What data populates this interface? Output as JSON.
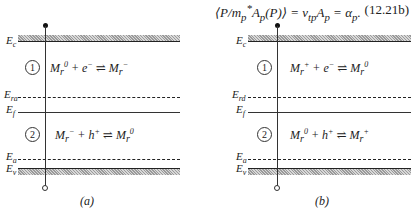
{
  "equation": {
    "text": "⟨P/m*ₚAₚ(P)⟩ = v_tpAₚ = αₚ.",
    "number": "(12.21b)"
  },
  "panels": [
    {
      "caption": "(a)",
      "levels": {
        "Ec": "E",
        "Ec_sub": "c",
        "Er": "E",
        "Er_sub": "ra",
        "Ef": "E",
        "Ef_sub": "f",
        "Ea": "E",
        "Ea_sub": "a",
        "Ev": "E",
        "Ev_sub": "v"
      },
      "region1": {
        "marker": "1",
        "reaction": "M_r⁰ + e⁻ ⇌ M_r⁻"
      },
      "region2": {
        "marker": "2",
        "reaction": "M_r⁻ + h⁺ ⇌ M_r⁰"
      }
    },
    {
      "caption": "(b)",
      "levels": {
        "Ec": "E",
        "Ec_sub": "c",
        "Er": "E",
        "Er_sub": "rd",
        "Ef": "E",
        "Ef_sub": "f",
        "Ea": "E",
        "Ea_sub": "a",
        "Ev": "E",
        "Ev_sub": "v"
      },
      "region1": {
        "marker": "1",
        "reaction": "M_r⁺ + e⁻ ⇌ M_r⁰"
      },
      "region2": {
        "marker": "2",
        "reaction": "M_r⁰ + h⁺ ⇌ M_r⁺"
      }
    }
  ]
}
